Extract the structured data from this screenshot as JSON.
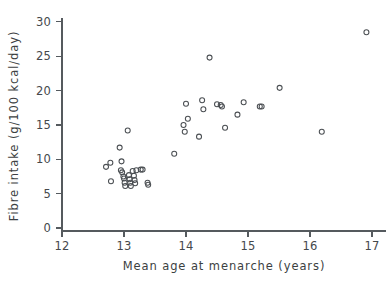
{
  "chart_data": {
    "type": "scatter",
    "title": "",
    "xlabel": "Mean age at menarche (years)",
    "ylabel": "Fibre intake (g/100 kcal/day)",
    "xlim": [
      12,
      17
    ],
    "ylim": [
      0,
      31
    ],
    "xticks": [
      12,
      13,
      14,
      15,
      16,
      17
    ],
    "yticks": [
      0,
      5,
      10,
      15,
      20,
      25,
      30
    ],
    "xtick_labels": [
      "12",
      "13",
      "14",
      "15",
      "16",
      "17"
    ],
    "ytick_labels": [
      "0",
      "5",
      "10",
      "15",
      "20",
      "25",
      "30"
    ],
    "grid": false,
    "legend": null,
    "marker": "open-circle",
    "marker_color": "#4b4f53",
    "n_points": 46,
    "points": [
      {
        "x": 12.71,
        "y": 8.9
      },
      {
        "x": 12.78,
        "y": 9.5
      },
      {
        "x": 12.79,
        "y": 6.8
      },
      {
        "x": 12.93,
        "y": 11.7
      },
      {
        "x": 12.96,
        "y": 9.7
      },
      {
        "x": 12.95,
        "y": 8.4
      },
      {
        "x": 12.97,
        "y": 8.1
      },
      {
        "x": 12.99,
        "y": 7.5
      },
      {
        "x": 13.0,
        "y": 7.2
      },
      {
        "x": 13.01,
        "y": 6.6
      },
      {
        "x": 13.02,
        "y": 6.1
      },
      {
        "x": 13.06,
        "y": 14.2
      },
      {
        "x": 13.08,
        "y": 7.7
      },
      {
        "x": 13.09,
        "y": 7.1
      },
      {
        "x": 13.1,
        "y": 6.6
      },
      {
        "x": 13.11,
        "y": 6.1
      },
      {
        "x": 13.14,
        "y": 8.3
      },
      {
        "x": 13.16,
        "y": 7.6
      },
      {
        "x": 13.17,
        "y": 7.0
      },
      {
        "x": 13.18,
        "y": 6.5
      },
      {
        "x": 13.2,
        "y": 8.4
      },
      {
        "x": 13.27,
        "y": 8.5
      },
      {
        "x": 13.3,
        "y": 8.5
      },
      {
        "x": 13.38,
        "y": 6.6
      },
      {
        "x": 13.39,
        "y": 6.3
      },
      {
        "x": 13.81,
        "y": 10.8
      },
      {
        "x": 13.96,
        "y": 15.0
      },
      {
        "x": 13.98,
        "y": 14.0
      },
      {
        "x": 14.0,
        "y": 18.1
      },
      {
        "x": 14.03,
        "y": 15.9
      },
      {
        "x": 14.21,
        "y": 13.3
      },
      {
        "x": 14.26,
        "y": 18.6
      },
      {
        "x": 14.28,
        "y": 17.3
      },
      {
        "x": 14.38,
        "y": 24.8
      },
      {
        "x": 14.5,
        "y": 18.0
      },
      {
        "x": 14.56,
        "y": 17.9
      },
      {
        "x": 14.58,
        "y": 17.7
      },
      {
        "x": 14.63,
        "y": 14.6
      },
      {
        "x": 14.83,
        "y": 16.5
      },
      {
        "x": 14.93,
        "y": 18.3
      },
      {
        "x": 15.19,
        "y": 17.7
      },
      {
        "x": 15.22,
        "y": 17.7
      },
      {
        "x": 15.51,
        "y": 20.4
      },
      {
        "x": 16.19,
        "y": 14.0
      },
      {
        "x": 16.91,
        "y": 28.5
      }
    ]
  },
  "layout": {
    "x_axis_pixel_origin": 62,
    "x_axis_pixel_per_unit": 62,
    "y_axis_pixel_origin": 228,
    "y_axis_pixel_per_unit": 6.87
  }
}
